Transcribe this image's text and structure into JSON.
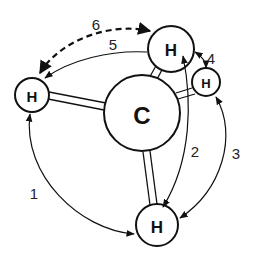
{
  "diagram": {
    "atoms": [
      {
        "id": "C",
        "label": "C"
      },
      {
        "id": "H_left",
        "label": "H"
      },
      {
        "id": "H_top",
        "label": "H"
      },
      {
        "id": "H_right",
        "label": "H"
      },
      {
        "id": "H_bottom",
        "label": "H"
      }
    ],
    "interactions": [
      {
        "label": "1",
        "from": "H_left",
        "to": "H_bottom",
        "style": "solid"
      },
      {
        "label": "2",
        "from": "H_bottom",
        "to": "H_top",
        "style": "solid"
      },
      {
        "label": "3",
        "from": "H_right",
        "to": "H_bottom",
        "style": "solid"
      },
      {
        "label": "4",
        "from": "H_top",
        "to": "H_right",
        "style": "solid"
      },
      {
        "label": "5",
        "from": "H_top",
        "to": "H_left",
        "style": "solid"
      },
      {
        "label": "6",
        "from": "H_left",
        "to": "H_top",
        "style": "dashed"
      }
    ]
  }
}
